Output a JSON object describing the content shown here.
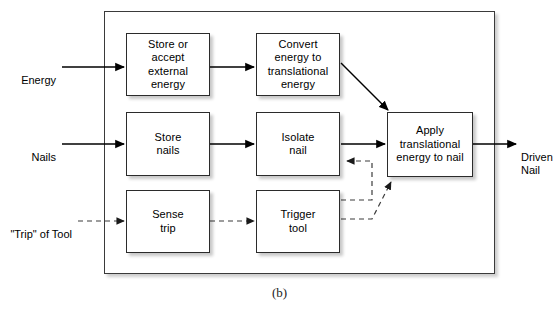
{
  "figure": {
    "caption": "(b)",
    "boundary_name": "system-boundary"
  },
  "inputs": [
    {
      "id": "energy",
      "label": "Energy",
      "line_style": "solid"
    },
    {
      "id": "nails",
      "label": "Nails",
      "line_style": "solid"
    },
    {
      "id": "trip-of-tool",
      "label": "\"Trip\" of Tool",
      "line_style": "dashed"
    }
  ],
  "outputs": [
    {
      "id": "driven-nail",
      "label": "Driven\nNail",
      "line_style": "solid"
    }
  ],
  "blocks": [
    {
      "id": "store-or-accept-external-energy",
      "label": "Store or\naccept\nexternal\nenergy"
    },
    {
      "id": "convert-energy-to-translational-energy",
      "label": "Convert\nenergy to\ntranslational\nenergy"
    },
    {
      "id": "store-nails",
      "label": "Store\nnails"
    },
    {
      "id": "isolate-nail",
      "label": "Isolate\nnail"
    },
    {
      "id": "sense-trip",
      "label": "Sense\ntrip"
    },
    {
      "id": "trigger-tool",
      "label": "Trigger\ntool"
    },
    {
      "id": "apply-translational-energy-to-nail",
      "label": "Apply\ntranslational\nenergy to nail"
    }
  ],
  "connections": [
    {
      "id": "energy-to-store-energy",
      "from": "energy",
      "to": "store-or-accept-external-energy",
      "style": "solid"
    },
    {
      "id": "store-energy-to-convert",
      "from": "store-or-accept-external-energy",
      "to": "convert-energy-to-translational-energy",
      "style": "solid"
    },
    {
      "id": "convert-to-apply",
      "from": "convert-energy-to-translational-energy",
      "to": "apply-translational-energy-to-nail",
      "style": "solid"
    },
    {
      "id": "nails-to-store-nails",
      "from": "nails",
      "to": "store-nails",
      "style": "solid"
    },
    {
      "id": "store-nails-to-isolate",
      "from": "store-nails",
      "to": "isolate-nail",
      "style": "solid"
    },
    {
      "id": "isolate-to-apply",
      "from": "isolate-nail",
      "to": "apply-translational-energy-to-nail",
      "style": "solid"
    },
    {
      "id": "apply-to-driven-nail",
      "from": "apply-translational-energy-to-nail",
      "to": "driven-nail",
      "style": "solid"
    },
    {
      "id": "trip-to-sense-trip",
      "from": "trip-of-tool",
      "to": "sense-trip",
      "style": "dashed"
    },
    {
      "id": "sense-trip-to-trigger-tool",
      "from": "sense-trip",
      "to": "trigger-tool",
      "style": "dashed"
    },
    {
      "id": "trigger-tool-to-isolate",
      "from": "trigger-tool",
      "to": "isolate-nail",
      "style": "dashed"
    },
    {
      "id": "trigger-tool-to-apply",
      "from": "trigger-tool",
      "to": "apply-translational-energy-to-nail",
      "style": "dashed"
    }
  ],
  "colors": {
    "line": "#000000",
    "dashed_line": "#3c3c3c",
    "box_border": "#2b2b2b",
    "frame_border": "#3a3a3a",
    "background": "#ffffff",
    "text": "#000000"
  }
}
